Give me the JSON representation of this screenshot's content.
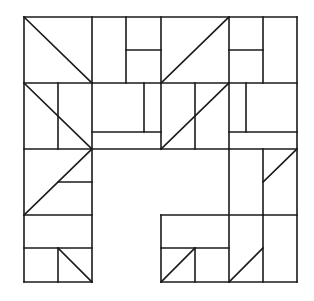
{
  "diagram": {
    "title": "",
    "width": 314,
    "height": 301,
    "stroke_color": "#1a1a1a",
    "background": "#ffffff",
    "segments": [
      [
        24,
        17,
        297,
        17
      ],
      [
        24,
        17,
        24,
        282
      ],
      [
        297,
        17,
        297,
        282
      ],
      [
        24,
        83,
        297,
        83
      ],
      [
        24,
        149,
        229,
        149
      ],
      [
        92,
        17,
        92,
        282
      ],
      [
        161,
        17,
        161,
        149
      ],
      [
        229,
        17,
        229,
        282
      ],
      [
        24,
        215,
        92,
        215
      ],
      [
        24,
        282,
        92,
        282
      ],
      [
        161,
        215,
        297,
        215
      ],
      [
        161,
        215,
        161,
        282
      ],
      [
        161,
        282,
        297,
        282
      ],
      [
        229,
        149,
        297,
        149
      ],
      [
        24,
        17,
        92,
        83
      ],
      [
        126,
        17,
        126,
        83
      ],
      [
        126,
        50,
        161,
        50
      ],
      [
        161,
        83,
        229,
        17
      ],
      [
        263,
        17,
        263,
        83
      ],
      [
        229,
        50,
        263,
        50
      ],
      [
        58,
        83,
        58,
        149
      ],
      [
        24,
        83,
        92,
        149
      ],
      [
        144,
        83,
        144,
        132
      ],
      [
        92,
        132,
        161,
        132
      ],
      [
        195,
        83,
        195,
        149
      ],
      [
        161,
        149,
        229,
        83
      ],
      [
        246,
        83,
        246,
        132
      ],
      [
        229,
        132,
        297,
        132
      ],
      [
        24,
        215,
        92,
        149
      ],
      [
        58,
        182,
        92,
        182
      ],
      [
        263,
        149,
        263,
        215
      ],
      [
        263,
        182,
        297,
        149
      ],
      [
        24,
        248,
        92,
        248
      ],
      [
        58,
        248,
        58,
        282
      ],
      [
        58,
        248,
        92,
        282
      ],
      [
        161,
        248,
        229,
        248
      ],
      [
        195,
        248,
        195,
        282
      ],
      [
        161,
        282,
        195,
        248
      ],
      [
        263,
        215,
        263,
        282
      ],
      [
        229,
        282,
        263,
        248
      ]
    ]
  }
}
